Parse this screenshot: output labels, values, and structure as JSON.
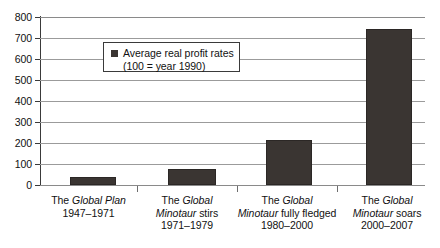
{
  "chart_data": {
    "type": "bar",
    "title": "",
    "subtitle": "",
    "xlabel": "",
    "ylabel": "",
    "ylim": [
      0,
      800
    ],
    "ytick_step": 100,
    "yticks": [
      "0",
      "100",
      "200",
      "300",
      "400",
      "500",
      "600",
      "700",
      "800"
    ],
    "grid": true,
    "legend_position": "inside-top-left",
    "legend": [
      {
        "label_line1": "Average real profit rates",
        "label_line2": "(100 = year 1990)",
        "color": "#3a3532",
        "swatch": "square-marker-icon"
      }
    ],
    "categories": [
      "The Global Plan 1947–1971",
      "The Global Minotaur stirs 1971–1979",
      "The Global Minotaur fully fledged 1980–2000",
      "The Global Minotaur soars 2000–2007"
    ],
    "values": [
      38,
      76,
      214,
      743
    ],
    "series": [
      {
        "name": "Average real profit rates (100 = year 1990)",
        "values": [
          38,
          76,
          214,
          743
        ],
        "color": "#3a3532"
      }
    ]
  },
  "axis": {
    "y_tick_labels": [
      "800",
      "700",
      "600",
      "500",
      "400",
      "300",
      "200",
      "100",
      "0"
    ]
  },
  "categories_formatted": [
    {
      "line1_pre": "The ",
      "line1_italic": "Global Plan",
      "line1_post": "",
      "line2": "1947–1971",
      "line3": ""
    },
    {
      "line1_pre": "The ",
      "line1_italic": "Global",
      "line1_post": "",
      "line2_italic": "Minotaur",
      "line2_post": " stirs",
      "line3": "1971–1979"
    },
    {
      "line1_pre": "The ",
      "line1_italic": "Global",
      "line1_post": "",
      "line2_italic": "Minotaur",
      "line2_post": " fully fledged",
      "line3": "1980–2000"
    },
    {
      "line1_pre": "The ",
      "line1_italic": "Global",
      "line1_post": "",
      "line2_italic": "Minotaur",
      "line2_post": " soars",
      "line3": "2000–2007"
    }
  ],
  "legend": {
    "line1": "Average real profit rates",
    "line2": "(100 = year 1990)"
  },
  "colors": {
    "bar": "#3a3532",
    "grid": "#9b9b9b",
    "axis": "#3a3a3a",
    "text": "#111111",
    "background": "#ffffff"
  }
}
